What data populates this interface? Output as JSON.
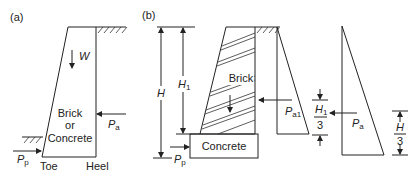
{
  "panel_a": {
    "label": "(a)",
    "weight_label": "W",
    "material_lines": [
      "Brick",
      "or",
      "Concrete"
    ],
    "active_force": {
      "main": "P",
      "sub": "a"
    },
    "passive_force": {
      "main": "P",
      "sub": "p"
    },
    "toe_label": "Toe",
    "heel_label": "Heel"
  },
  "panel_b": {
    "label": "(b)",
    "height_label": "H",
    "height1_label": {
      "main": "H",
      "sub": "1"
    },
    "wall_material": "Brick",
    "base_material": "Concrete",
    "passive_force": {
      "main": "P",
      "sub": "p"
    },
    "pressure_diagram_1": {
      "force": {
        "main": "P",
        "sub": "a1"
      },
      "lever_arm": {
        "num_main": "H",
        "num_sub": "1",
        "den": "3"
      }
    },
    "pressure_diagram_2": {
      "force": {
        "main": "P",
        "sub": "a"
      },
      "lever_arm": {
        "num_main": "H",
        "den": "3"
      }
    }
  }
}
